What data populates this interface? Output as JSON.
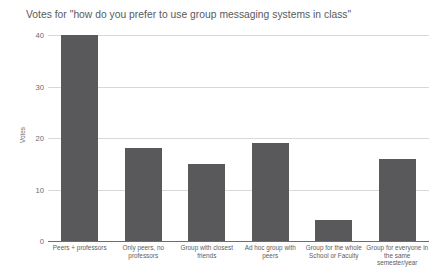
{
  "chart_data": {
    "type": "bar",
    "title": "Votes for \"how do you prefer to use group messaging systems in class\"",
    "xlabel": "",
    "ylabel": "Votes",
    "categories": [
      "Peers + professors",
      "Only peers, no professors",
      "Group with closest friends",
      "Ad hoc group with peers",
      "Group for the whole School or Faculty",
      "Group for everyone in the same semester/year"
    ],
    "values": [
      40,
      18,
      15,
      19,
      4,
      16
    ],
    "ylim": [
      0,
      40
    ],
    "yticks": [
      0,
      10,
      20,
      30,
      40
    ],
    "ytick_labels": [
      "0",
      "10",
      "20",
      "30",
      "40"
    ],
    "grid": true,
    "legend": false,
    "bar_color": "#59595b",
    "background_color": "#ffffff",
    "gridline_color": "#d8d8d8",
    "axis_color": "#6d6d6d"
  }
}
